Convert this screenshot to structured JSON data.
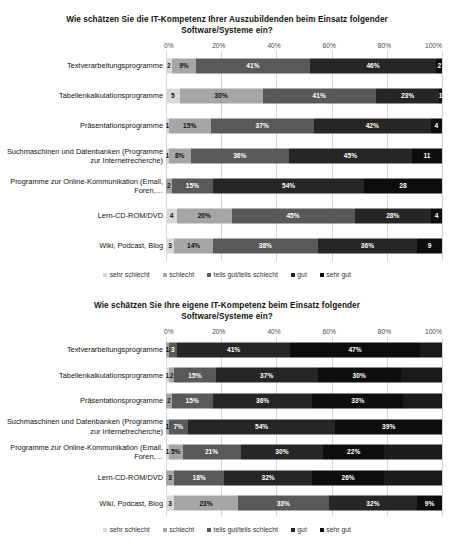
{
  "palette": {
    "sehr_schlecht": "#d9d9d9",
    "schlecht": "#a6a6a6",
    "teils": "#595959",
    "gut": "#262626",
    "sehr_gut": "#0d0d0d",
    "grid": "#d5d5d5",
    "label_light": "#ffffff",
    "label_dark": "#111111"
  },
  "legend": {
    "items": [
      {
        "label": "sehr schlecht",
        "color": "#d9d9d9"
      },
      {
        "label": "schlecht",
        "color": "#a6a6a6"
      },
      {
        "label": "teils gut/teils schlecht",
        "color": "#595959"
      },
      {
        "label": "gut",
        "color": "#262626"
      },
      {
        "label": "sehr gut",
        "color": "#0d0d0d"
      }
    ]
  },
  "axis": {
    "ticks": [
      "0%",
      "20%",
      "40%",
      "60%",
      "80%",
      "100%"
    ]
  },
  "chart_data": [
    {
      "type": "bar",
      "orientation": "horizontal",
      "stacked": true,
      "percent": true,
      "title": "Wie schätzen Sie die IT-Kompetenz Ihrer Auszubildenden beim Einsatz folgender Software/Systeme ein?",
      "xlabel": "",
      "ylabel": "",
      "xlim": [
        0,
        100
      ],
      "xticks": [
        "0%",
        "20%",
        "40%",
        "60%",
        "80%",
        "100%"
      ],
      "grid": true,
      "legend_position": "bottom",
      "categories": [
        "Textverarbeitungsprogramme",
        "Tabellenkalkulationsprogramme",
        "Präsentationsprogramme",
        "Suchmaschinen und Datenbanken (Programme zur Internetrecherche)",
        "Programme zur Online-Kommunikation (Email, Foren,…",
        "Lern-CD-ROM/DVD",
        "Wiki, Podcast, Blog"
      ],
      "series": [
        {
          "name": "sehr schlecht",
          "color": "#d9d9d9",
          "values": [
            2,
            5,
            1,
            1,
            0,
            4,
            3
          ],
          "labels": [
            "2",
            "5",
            "1",
            "1",
            "0",
            "4",
            "3"
          ]
        },
        {
          "name": "schlecht",
          "color": "#a6a6a6",
          "values": [
            9,
            30,
            15,
            8,
            2,
            20,
            14
          ],
          "labels": [
            "9%",
            "30%",
            "15%",
            "8%",
            "2",
            "20%",
            "14%"
          ]
        },
        {
          "name": "teils gut/teils schlecht",
          "color": "#595959",
          "values": [
            41,
            41,
            37,
            36,
            15,
            45,
            38
          ],
          "labels": [
            "41%",
            "41%",
            "37%",
            "36%",
            "15%",
            "45%",
            "38%"
          ]
        },
        {
          "name": "gut",
          "color": "#262626",
          "values": [
            46,
            23,
            42,
            45,
            54,
            28,
            36
          ],
          "labels": [
            "46%",
            "23%",
            "42%",
            "45%",
            "54%",
            "28%",
            "36%"
          ]
        },
        {
          "name": "sehr gut",
          "color": "#0d0d0d",
          "values": [
            2,
            1,
            4,
            11,
            28,
            4,
            9
          ],
          "labels": [
            "2",
            "1",
            "4",
            "11",
            "28",
            "4",
            "9"
          ]
        }
      ]
    },
    {
      "type": "bar",
      "orientation": "horizontal",
      "stacked": true,
      "percent": true,
      "title": "Wie schätzen Sie Ihre eigene IT-Kompetenz beim Einsatz folgender Software/Systeme ein?",
      "xlabel": "",
      "ylabel": "",
      "xlim": [
        0,
        100
      ],
      "xticks": [
        "0%",
        "20%",
        "40%",
        "60%",
        "80%",
        "100%"
      ],
      "grid": true,
      "legend_position": "bottom",
      "categories": [
        "Textverarbeitungsprogramme",
        "Tabellenkalkulationsprogramme",
        "Präsentationsprogramme",
        "Suchmaschinen und Datenbanken (Programme zur Internetrecherche)",
        "Programme zur Online-Kommunikation (Email, Foren,…",
        "Lern-CD-ROM/DVD",
        "Wiki, Podcast, Blog"
      ],
      "series": [
        {
          "name": "sehr schlecht",
          "color": "#d9d9d9",
          "values": [
            0,
            1,
            0,
            0,
            1,
            0,
            3
          ],
          "labels": [
            "0",
            "1",
            "0",
            "0",
            "1",
            "0",
            "3"
          ]
        },
        {
          "name": "schlecht",
          "color": "#a6a6a6",
          "values": [
            1,
            2,
            2,
            1,
            5,
            3,
            23
          ],
          "labels": [
            "1",
            "2",
            "2",
            "1",
            "5%",
            "3",
            "23%"
          ]
        },
        {
          "name": "teils gut/teils schlecht",
          "color": "#595959",
          "values": [
            3,
            15,
            15,
            7,
            21,
            18,
            33
          ],
          "labels": [
            "3",
            "15%",
            "15%",
            "7%",
            "21%",
            "18%",
            "33%"
          ]
        },
        {
          "name": "gut",
          "color": "#262626",
          "values": [
            41,
            37,
            36,
            54,
            30,
            32,
            32
          ],
          "labels": [
            "41%",
            "37%",
            "36%",
            "54%",
            "30%",
            "32%",
            "32%"
          ]
        },
        {
          "name": "sehr gut",
          "color": "#0d0d0d",
          "values": [
            47,
            30,
            33,
            39,
            22,
            26,
            9
          ],
          "labels": [
            "47%",
            "30%",
            "33%",
            "39%",
            "22%",
            "26%",
            "9%"
          ]
        },
        {
          "name": "rest",
          "color": "#1a1a1a",
          "values": [
            8,
            15,
            14,
            0,
            21,
            21,
            0
          ],
          "labels": [
            "",
            "",
            "",
            "",
            "",
            "",
            ""
          ]
        }
      ]
    }
  ]
}
